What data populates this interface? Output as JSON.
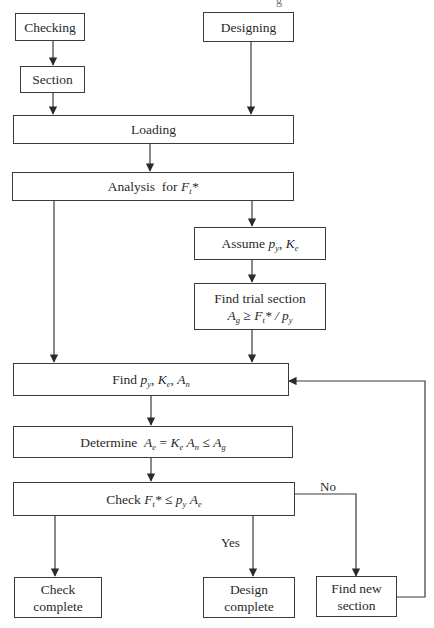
{
  "diagram": {
    "title_fragment": "g",
    "nodes": {
      "checking": {
        "label": "Checking"
      },
      "section": {
        "label": "Section"
      },
      "designing": {
        "label": "Designing"
      },
      "loading": {
        "label": "Loading"
      },
      "analysis": {
        "label_text": "Analysis  for ",
        "math": {
          "var": "F",
          "sub": "t",
          "suffix": "*"
        }
      },
      "assume": {
        "label_text": "Assume ",
        "math_1": {
          "var": "p",
          "sub": "y",
          "suffix": ", "
        },
        "math_2": {
          "var": "K",
          "sub": "e"
        }
      },
      "trial": {
        "line1": "Find trial section",
        "math_a": {
          "var": "A",
          "sub": "g"
        },
        "op": " ≥ ",
        "math_f": {
          "var": "F",
          "sub": "t",
          "suffix": "* / "
        },
        "math_p": {
          "var": "p",
          "sub": "y"
        }
      },
      "find": {
        "label_text": "Find ",
        "math_1": {
          "var": "p",
          "sub": "y",
          "suffix": ", "
        },
        "math_2": {
          "var": "K",
          "sub": "e",
          "suffix": ", "
        },
        "math_3": {
          "var": "A",
          "sub": "n"
        }
      },
      "determine": {
        "label_text": "Determine  ",
        "math_1": {
          "var": "A",
          "sub": "e"
        },
        "op1": " = ",
        "math_2": {
          "var": "K",
          "sub": "e",
          "suffix": " "
        },
        "math_3": {
          "var": "A",
          "sub": "n"
        },
        "op2": " ≤ ",
        "math_4": {
          "var": "A",
          "sub": "g"
        }
      },
      "check": {
        "label_text": "Check ",
        "math_1": {
          "var": "F",
          "sub": "t",
          "suffix": "*"
        },
        "op": " ≤ ",
        "math_2": {
          "var": "p",
          "sub": "y",
          "suffix": " "
        },
        "math_3": {
          "var": "A",
          "sub": "e"
        }
      },
      "check_complete": {
        "line1": "Check",
        "line2": "complete"
      },
      "design_complete": {
        "line1": "Design",
        "line2": "complete"
      },
      "find_new_section": {
        "line1": "Find new",
        "line2": "section"
      }
    },
    "edge_labels": {
      "yes": "Yes",
      "no": "No"
    },
    "colors": {
      "stroke": "#3a3a3a",
      "text": "#2a2a2a",
      "background": "#ffffff"
    }
  }
}
